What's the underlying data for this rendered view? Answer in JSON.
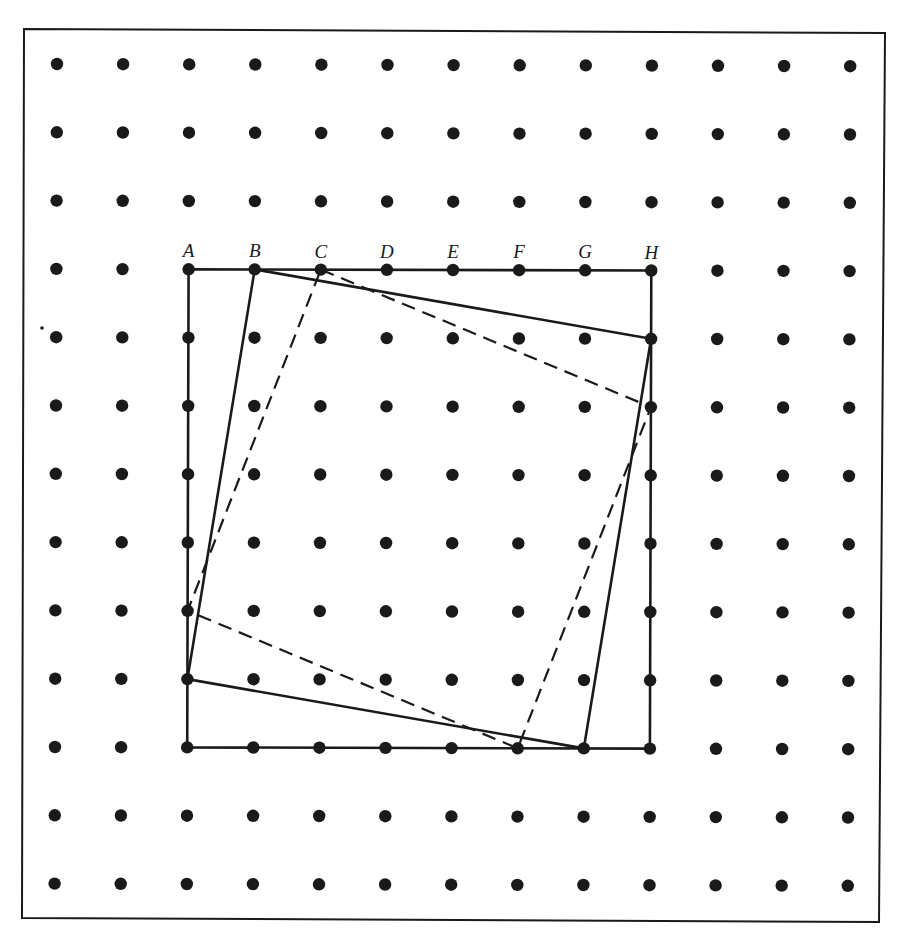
{
  "diagram": {
    "grid": {
      "rows": 13,
      "cols": 13,
      "origin_x": 57,
      "origin_y": 64,
      "spacing_x": 66.1,
      "spacing_y": 68.3,
      "dot_radius": 6.2,
      "dot_color": "#1a1a1a"
    },
    "frame": {
      "points": [
        [
          24,
          29
        ],
        [
          885,
          33
        ],
        [
          879,
          922
        ],
        [
          22,
          918
        ]
      ],
      "stroke": "#1a1a1a"
    },
    "labels": [
      {
        "text": "A",
        "col": 2
      },
      {
        "text": "B",
        "col": 3
      },
      {
        "text": "C",
        "col": 4
      },
      {
        "text": "D",
        "col": 5
      },
      {
        "text": "E",
        "col": 6
      },
      {
        "text": "F",
        "col": 7
      },
      {
        "text": "G",
        "col": 8
      },
      {
        "text": "H",
        "col": 9
      }
    ],
    "label_row": 3,
    "shapes": [
      {
        "name": "outer-square",
        "style": "solid",
        "grid_points": [
          [
            2,
            3
          ],
          [
            9,
            3
          ],
          [
            9,
            10
          ],
          [
            2,
            10
          ]
        ]
      },
      {
        "name": "tilted-square-solid",
        "style": "solid",
        "grid_points": [
          [
            3,
            3
          ],
          [
            9,
            4
          ],
          [
            8,
            10
          ],
          [
            2,
            9
          ]
        ]
      },
      {
        "name": "tilted-square-dashed",
        "style": "dashed",
        "grid_points": [
          [
            4,
            3
          ],
          [
            9,
            5
          ],
          [
            7,
            10
          ],
          [
            2,
            8
          ]
        ]
      }
    ],
    "stroke_color": "#1a1a1a",
    "solid_width": 2.6,
    "dashed_width": 2.2,
    "dash_pattern": "14 8"
  }
}
